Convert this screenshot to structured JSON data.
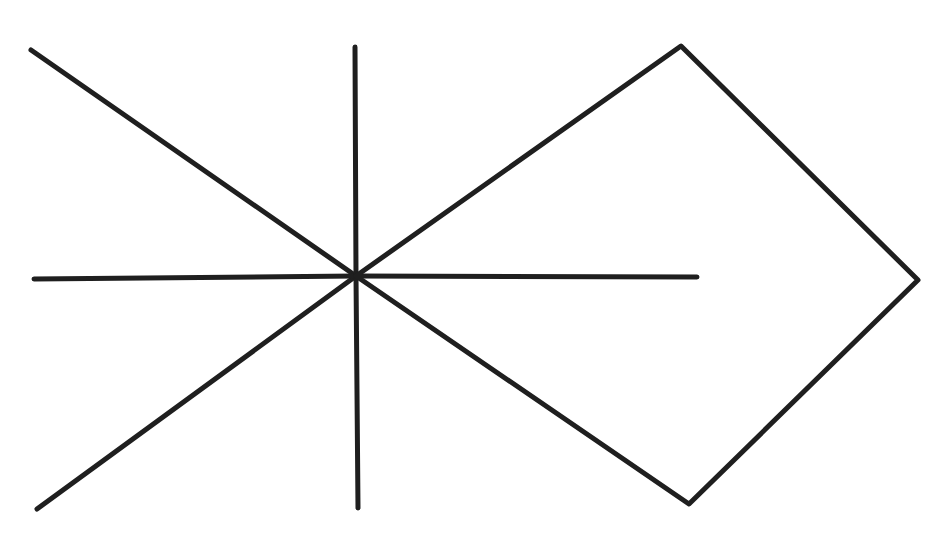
{
  "diagram": {
    "background": "#ffffff",
    "stroke_color": "#1f1f1f",
    "stroke_width": 5,
    "center": [
      356,
      276
    ],
    "rays": [
      {
        "name": "ray-upper-left",
        "from": [
          356,
          276
        ],
        "to": [
          31,
          50
        ]
      },
      {
        "name": "ray-lower-left",
        "from": [
          356,
          276
        ],
        "to": [
          37,
          509
        ]
      },
      {
        "name": "ray-vertical-up",
        "from": [
          356,
          276
        ],
        "to": [
          355,
          47
        ]
      },
      {
        "name": "ray-vertical-down",
        "from": [
          356,
          276
        ],
        "to": [
          358,
          508
        ]
      },
      {
        "name": "ray-horizontal-left",
        "from": [
          356,
          276
        ],
        "to": [
          34,
          279
        ]
      },
      {
        "name": "ray-horizontal-right",
        "from": [
          356,
          276
        ],
        "to": [
          697,
          277
        ]
      }
    ],
    "kite": {
      "name": "kite-shape",
      "points": [
        [
          356,
          276
        ],
        [
          681,
          46
        ],
        [
          918,
          280
        ],
        [
          689,
          504
        ],
        [
          356,
          276
        ]
      ]
    }
  }
}
